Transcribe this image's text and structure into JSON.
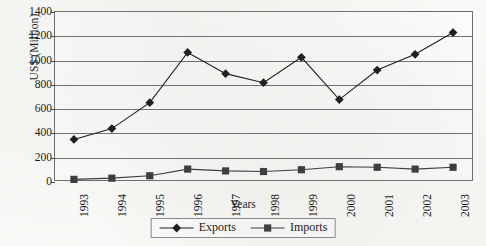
{
  "chart_data": {
    "type": "line",
    "title": "",
    "xlabel": "Years",
    "ylabel": "US$ (Million)",
    "categories": [
      "1993",
      "1994",
      "1995",
      "1996",
      "1997",
      "1998",
      "1999",
      "2000",
      "2001",
      "2002",
      "2003"
    ],
    "series": [
      {
        "name": "Exports",
        "marker": "diamond",
        "color": "#1a1a1a",
        "values": [
          345,
          435,
          650,
          1065,
          890,
          815,
          1025,
          675,
          920,
          1050,
          1230
        ]
      },
      {
        "name": "Imports",
        "marker": "square",
        "color": "#3a3a3a",
        "values": [
          15,
          25,
          45,
          100,
          85,
          80,
          95,
          120,
          115,
          100,
          115
        ]
      }
    ],
    "ylim": [
      0,
      1400
    ],
    "yticks": [
      0,
      200,
      400,
      600,
      800,
      1000,
      1200,
      1400
    ],
    "ytick_labels": [
      "0",
      "200",
      "400",
      "600",
      "800",
      "1000",
      "1200",
      "1400"
    ],
    "grid": "horizontal",
    "legend_position": "bottom-center"
  },
  "legend": {
    "entries": [
      {
        "label": "Exports",
        "marker": "diamond-marker-icon"
      },
      {
        "label": "Imports",
        "marker": "square-marker-icon"
      }
    ]
  },
  "axes": {
    "y_title": "US$ (Million)",
    "x_title": "Years"
  },
  "colors": {
    "exports": "#1a1a1a",
    "imports": "#3a3a3a",
    "gridline": "#707070",
    "frame": "#6e6e6e",
    "background": "#fbfbf9"
  }
}
